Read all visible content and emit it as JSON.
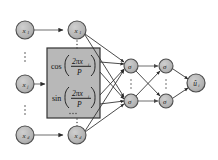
{
  "figure": {
    "type": "neural-network-architecture-diagram",
    "background_color": "#ffffff",
    "node_fill": "#b3b3b3",
    "node_stroke": "#4d4d4d",
    "box_fill": "#b8b8b8",
    "box_stroke": "#333333",
    "edge_color": "#6b6b6b",
    "edge_color_dark": "#2b2b2b"
  },
  "input_layer": {
    "name": "input-layer",
    "nodes": [
      {
        "id": "in-1",
        "label": "x",
        "sub": "1",
        "cx": 25,
        "cy": 30,
        "r": 9
      },
      {
        "id": "in-2",
        "label": "x",
        "sub": "j",
        "cx": 25,
        "cy": 84,
        "r": 9
      },
      {
        "id": "in-3",
        "label": "x",
        "sub": "d",
        "cx": 25,
        "cy": 135,
        "r": 9
      }
    ],
    "ellipses": [
      {
        "cx": 25,
        "cy": 57
      },
      {
        "cx": 25,
        "cy": 110
      }
    ]
  },
  "feature_layer": {
    "name": "feature-layer",
    "nodes": [
      {
        "id": "feat-1",
        "label": "x",
        "sub": "1",
        "cx": 77,
        "cy": 30,
        "r": 9
      },
      {
        "id": "feat-2",
        "label": "x",
        "sub": "d",
        "cx": 77,
        "cy": 135,
        "r": 9
      }
    ],
    "ellipses": [
      {
        "cx": 77,
        "cy": 44
      },
      {
        "cx": 77,
        "cy": 122
      }
    ]
  },
  "fourier_box": {
    "name": "fourier-feature-box",
    "x": 47,
    "y": 48,
    "width": 53,
    "height": 70,
    "rows": [
      {
        "id": "cos-row",
        "fn": "cos",
        "numerator": "2πx",
        "numerator_sub": "i",
        "denominator": "P"
      },
      {
        "id": "sin-row",
        "fn": "sin",
        "numerator": "2πx",
        "numerator_sub": "i",
        "denominator": "P"
      }
    ],
    "inner_ellipsis": {
      "cx": 73,
      "cy": 113
    }
  },
  "hidden_layer_1": {
    "name": "hidden-layer-1",
    "nodes": [
      {
        "id": "h1-1",
        "label": "σ",
        "cx": 131,
        "cy": 66,
        "r": 7
      },
      {
        "id": "h1-2",
        "label": "σ",
        "cx": 131,
        "cy": 101,
        "r": 7
      }
    ],
    "ellipsis": {
      "cx": 131,
      "cy": 84
    }
  },
  "hidden_layer_2": {
    "name": "hidden-layer-2",
    "nodes": [
      {
        "id": "h2-1",
        "label": "σ",
        "cx": 166,
        "cy": 66,
        "r": 7
      },
      {
        "id": "h2-2",
        "label": "σ",
        "cx": 166,
        "cy": 101,
        "r": 7
      }
    ],
    "ellipsis": {
      "cx": 166,
      "cy": 84
    }
  },
  "output_layer": {
    "name": "output-layer",
    "nodes": [
      {
        "id": "out-1",
        "label": "û",
        "sub": "i",
        "cx": 196,
        "cy": 83,
        "r": 9
      }
    ]
  },
  "labels": {
    "cos_fn": "cos",
    "sin_fn": "sin",
    "numerator": "2πx",
    "numerator_sub": "i",
    "denominator": "P",
    "sigma": "σ",
    "output": "û",
    "output_sub": "i",
    "input_x": "x",
    "sub_1": "1",
    "sub_j": "j",
    "sub_d": "d"
  }
}
